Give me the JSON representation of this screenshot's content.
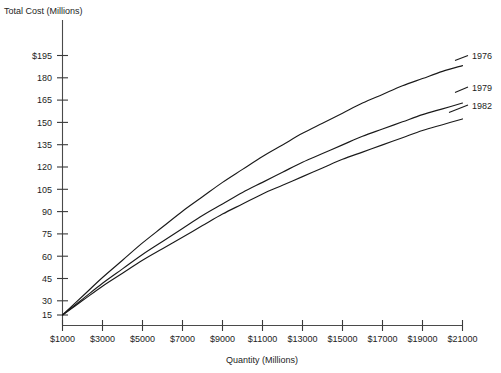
{
  "chart_data": {
    "type": "line",
    "title": "",
    "ylabel": "Total Cost (Millions)",
    "xlabel": "Quantity (Millions)",
    "grid": false,
    "legend_position": "right-inline-labels",
    "xlim": [
      0,
      21000
    ],
    "ylim": [
      0,
      202.5
    ],
    "x_tick_labels": [
      "$1000",
      "$3000",
      "$5000",
      "$7000",
      "$9000",
      "$11000",
      "$13000",
      "$15000",
      "$17000",
      "$19000",
      "$21000"
    ],
    "x_tick_values": [
      1000,
      3000,
      5000,
      7000,
      9000,
      11000,
      13000,
      15000,
      17000,
      19000,
      21000
    ],
    "y_tick_labels": [
      "$195",
      "180",
      "165",
      "150",
      "135",
      "120",
      "105",
      "90",
      "75",
      "60",
      "45",
      "30",
      "15"
    ],
    "y_tick_values": [
      195,
      180,
      165,
      150,
      135,
      120,
      105,
      90,
      75,
      60,
      45,
      30,
      15
    ],
    "x": [
      1000,
      2000,
      3000,
      4000,
      5000,
      6000,
      7000,
      8000,
      9000,
      10000,
      11000,
      12000,
      13000,
      14000,
      15000,
      16000,
      17000,
      18000,
      19000,
      20000,
      21000
    ],
    "series": [
      {
        "name": "1976",
        "label": "1976",
        "values": [
          15,
          28,
          41,
          53,
          65,
          76,
          87,
          97,
          107,
          116,
          125,
          133,
          141,
          148,
          155,
          162,
          168,
          174,
          179,
          184,
          188
        ]
      },
      {
        "name": "1979",
        "label": "1979",
        "values": [
          15,
          26,
          37,
          47,
          57,
          66,
          75,
          84,
          92,
          100,
          107,
          114,
          121,
          127,
          133,
          139,
          144,
          149,
          154,
          158,
          162
        ]
      },
      {
        "name": "1982",
        "label": "1982",
        "values": [
          15,
          25,
          35,
          44,
          53,
          61,
          69,
          77,
          85,
          92,
          99,
          105,
          111,
          117,
          123,
          128,
          133,
          138,
          143,
          147,
          151
        ]
      }
    ]
  },
  "axes": {
    "y_axis_title": "Total Cost (Millions)",
    "x_axis_title": "Quantity (Millions)"
  },
  "y_labels": {
    "l0": "$195",
    "l1": "180",
    "l2": "165",
    "l3": "150",
    "l4": "135",
    "l5": "120",
    "l6": "105",
    "l7": "90",
    "l8": "75",
    "l9": "60",
    "l10": "45",
    "l11": "30",
    "l12": "15"
  },
  "x_labels": {
    "l0": "$1000",
    "l1": "$3000",
    "l2": "$5000",
    "l3": "$7000",
    "l4": "$9000",
    "l5": "$11000",
    "l6": "$13000",
    "l7": "$15000",
    "l8": "$17000",
    "l9": "$19000",
    "l10": "$21000"
  },
  "series_labels": {
    "s0": "1976",
    "s1": "1979",
    "s2": "1982"
  },
  "colors": {
    "curve": "#1a1a1a",
    "axis": "#4a4a4a",
    "text": "#1d1d1d",
    "background": "#ffffff"
  }
}
